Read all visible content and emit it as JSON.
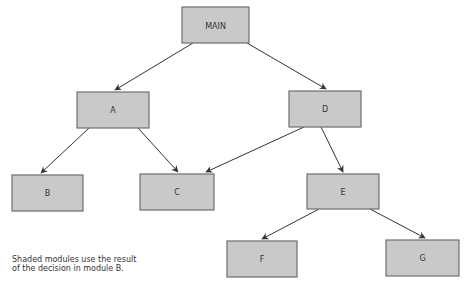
{
  "diagram": {
    "type": "structure-chart",
    "colors": {
      "box_fill": "#c9c9c9",
      "box_stroke": "#6f6f6f",
      "edge": "#333333"
    },
    "nodes": {
      "main": {
        "label": "MAIN",
        "x": 182,
        "y": 7,
        "w": 67,
        "h": 36
      },
      "a": {
        "label": "A",
        "x": 77,
        "y": 92,
        "w": 72,
        "h": 36
      },
      "d": {
        "label": "D",
        "x": 289,
        "y": 91,
        "w": 72,
        "h": 36
      },
      "b": {
        "label": "B",
        "x": 12,
        "y": 175,
        "w": 71,
        "h": 36
      },
      "c": {
        "label": "C",
        "x": 140,
        "y": 174,
        "w": 74,
        "h": 36
      },
      "e": {
        "label": "E",
        "x": 307,
        "y": 174,
        "w": 72,
        "h": 35
      },
      "f": {
        "label": "F",
        "x": 227,
        "y": 241,
        "w": 70,
        "h": 36
      },
      "g": {
        "label": "G",
        "x": 386,
        "y": 240,
        "w": 73,
        "h": 36
      }
    },
    "edges": [
      {
        "from": "MAIN",
        "to": "A"
      },
      {
        "from": "MAIN",
        "to": "D"
      },
      {
        "from": "A",
        "to": "B"
      },
      {
        "from": "A",
        "to": "C"
      },
      {
        "from": "D",
        "to": "C"
      },
      {
        "from": "D",
        "to": "E"
      },
      {
        "from": "E",
        "to": "F"
      },
      {
        "from": "E",
        "to": "G"
      }
    ],
    "note": {
      "line1": "Shaded modules use the result",
      "line2": "of the decision in module B."
    }
  }
}
